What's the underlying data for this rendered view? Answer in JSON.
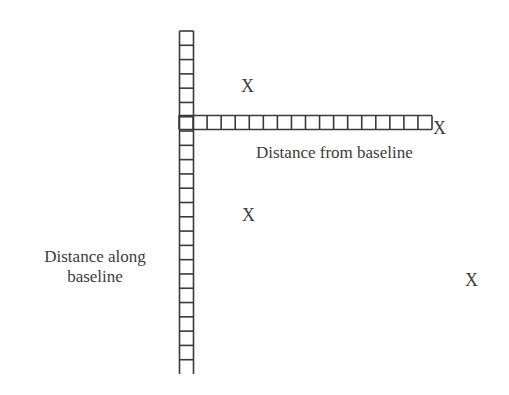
{
  "diagram": {
    "title": "",
    "labels": {
      "horizontal_axis": "Distance from baseline",
      "vertical_axis_line1": "Distance along",
      "vertical_axis_line2": "baseline"
    },
    "markers": [
      {
        "symbol": "X",
        "x": 248,
        "y": 86
      },
      {
        "symbol": "X",
        "x": 440,
        "y": 128
      },
      {
        "symbol": "X",
        "x": 249,
        "y": 215
      },
      {
        "symbol": "X",
        "x": 472,
        "y": 280
      }
    ],
    "rulers": {
      "vertical": {
        "x": 179,
        "top": 31,
        "bottom": 374,
        "width": 14,
        "cells": 24
      },
      "horizontal": {
        "y": 115,
        "left": 179,
        "right": 432,
        "height": 14,
        "cells": 18
      }
    },
    "colors": {
      "stroke": "#3a3a3a",
      "text": "#3c3c3c",
      "background": "#ffffff"
    }
  }
}
